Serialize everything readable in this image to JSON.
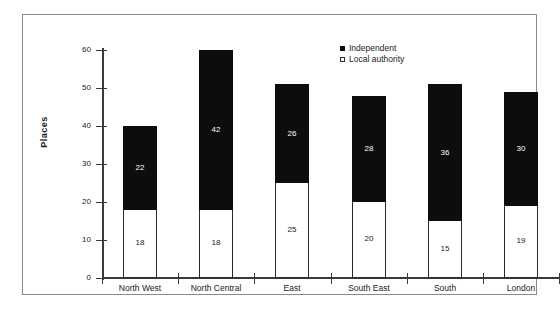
{
  "chart_data": {
    "type": "bar",
    "subtype": "stacked-bar",
    "title": "",
    "xlabel": "",
    "ylabel": "Places",
    "ylim": [
      0,
      60
    ],
    "ytick_values": [
      60,
      50,
      40,
      30,
      20,
      10,
      0
    ],
    "ytick_labels": [
      "60",
      "50",
      "40",
      "30",
      "20",
      "10",
      "0"
    ],
    "grid": false,
    "legend_position": "top-right",
    "categories": [
      "North West",
      "North Central",
      "East",
      "South East",
      "South",
      "London"
    ],
    "series": [
      {
        "name": "Independent",
        "color": "#0d0d0d",
        "marker": "filled-square",
        "values": [
          22,
          42,
          26,
          28,
          36,
          30
        ],
        "labels": [
          "22",
          "42",
          "26",
          "28",
          "36",
          "30"
        ]
      },
      {
        "name": "Local authority",
        "color": "#ffffff",
        "marker": "open-square",
        "values": [
          18,
          18,
          25,
          20,
          15,
          19
        ],
        "labels": [
          "18",
          "18",
          "25",
          "20",
          "15",
          "19"
        ]
      }
    ],
    "totals": [
      40,
      60,
      51,
      48,
      51,
      49
    ]
  },
  "legend": {
    "items": [
      {
        "label": "Independent",
        "swatch": "filled-square-icon"
      },
      {
        "label": "Local authority",
        "swatch": "open-square-icon"
      }
    ]
  }
}
